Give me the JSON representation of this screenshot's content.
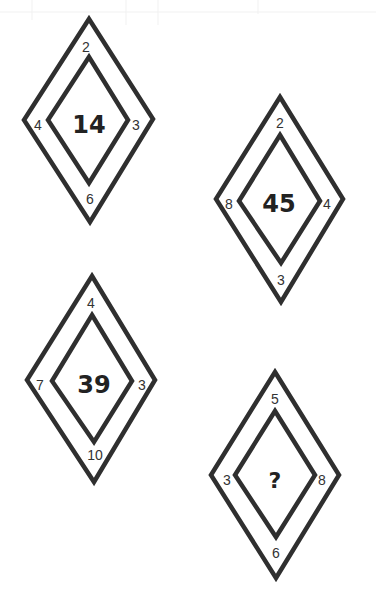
{
  "puzzle": {
    "diamonds": [
      {
        "top": "2",
        "left": "4",
        "right": "3",
        "bottom": "6",
        "center": "14",
        "outer": [
          [
            89,
            19
          ],
          [
            153,
            119
          ],
          [
            90,
            222
          ],
          [
            24,
            120
          ]
        ],
        "inner": [
          [
            89,
            57
          ],
          [
            128,
            120
          ],
          [
            89,
            183
          ],
          [
            48,
            120
          ]
        ],
        "pos": {
          "top": [
            86,
            47
          ],
          "left": [
            38,
            125
          ],
          "right": [
            136,
            125
          ],
          "bottom": [
            90,
            199
          ],
          "center": [
            89,
            125
          ]
        }
      },
      {
        "top": "2",
        "left": "8",
        "right": "4",
        "bottom": "3",
        "center": "45",
        "outer": [
          [
            280,
            97
          ],
          [
            343,
            199
          ],
          [
            281,
            302
          ],
          [
            216,
            199
          ]
        ],
        "inner": [
          [
            280,
            135
          ],
          [
            320,
            201
          ],
          [
            281,
            263
          ],
          [
            239,
            201
          ]
        ],
        "pos": {
          "top": [
            280,
            123
          ],
          "left": [
            229,
            204
          ],
          "right": [
            327,
            204
          ],
          "bottom": [
            281,
            280
          ],
          "center": [
            279,
            204
          ]
        }
      },
      {
        "top": "4",
        "left": "7",
        "right": "3",
        "bottom": "10",
        "center": "39",
        "outer": [
          [
            92,
            276
          ],
          [
            155,
            380
          ],
          [
            94,
            482
          ],
          [
            27,
            380
          ]
        ],
        "inner": [
          [
            92,
            315
          ],
          [
            132,
            381
          ],
          [
            94,
            442
          ],
          [
            52,
            381
          ]
        ],
        "pos": {
          "top": [
            91,
            303
          ],
          "left": [
            40,
            385
          ],
          "right": [
            142,
            385
          ],
          "bottom": [
            95,
            455
          ],
          "center": [
            94,
            385
          ]
        }
      },
      {
        "top": "5",
        "left": "3",
        "right": "8",
        "bottom": "6",
        "center": "?",
        "outer": [
          [
            275,
            372
          ],
          [
            339,
            475
          ],
          [
            276,
            578
          ],
          [
            211,
            475
          ]
        ],
        "inner": [
          [
            275,
            411
          ],
          [
            315,
            475
          ],
          [
            276,
            537
          ],
          [
            235,
            475
          ]
        ],
        "pos": {
          "top": [
            275,
            399
          ],
          "left": [
            227,
            480
          ],
          "right": [
            322,
            480
          ],
          "bottom": [
            276,
            553
          ],
          "center": [
            275,
            480
          ]
        }
      }
    ],
    "colors": {
      "stroke": "#2f2f2f",
      "text": "#333333",
      "background": "#ffffff"
    }
  }
}
